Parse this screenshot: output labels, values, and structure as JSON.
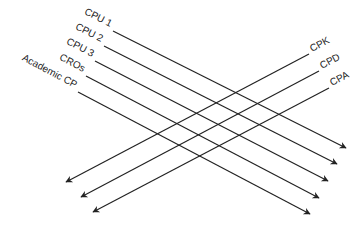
{
  "diagram": {
    "descending": [
      {
        "label": "CPU 1",
        "x1": 113,
        "y1": 31,
        "x2": 346,
        "y2": 148,
        "lx": 110,
        "ly": 27
      },
      {
        "label": "CPU 2",
        "x1": 104,
        "y1": 46,
        "x2": 337,
        "y2": 164,
        "lx": 101,
        "ly": 42
      },
      {
        "label": "CPU 3",
        "x1": 95,
        "y1": 61,
        "x2": 328,
        "y2": 181,
        "lx": 92,
        "ly": 57
      },
      {
        "label": "CROs",
        "x1": 86,
        "y1": 76,
        "x2": 319,
        "y2": 198,
        "lx": 83,
        "ly": 72
      },
      {
        "label": "Academic CP",
        "x1": 78,
        "y1": 92,
        "x2": 310,
        "y2": 214,
        "lx": 75,
        "ly": 88
      }
    ],
    "ascending": [
      {
        "label": "CPK",
        "x1": 309,
        "y1": 54,
        "x2": 66,
        "y2": 182,
        "lx": 312,
        "ly": 52
      },
      {
        "label": "CPD",
        "x1": 319,
        "y1": 71,
        "x2": 81,
        "y2": 197,
        "lx": 322,
        "ly": 69
      },
      {
        "label": "CPA",
        "x1": 329,
        "y1": 88,
        "x2": 93,
        "y2": 212,
        "lx": 332,
        "ly": 86
      }
    ],
    "line_color": "#222222"
  }
}
